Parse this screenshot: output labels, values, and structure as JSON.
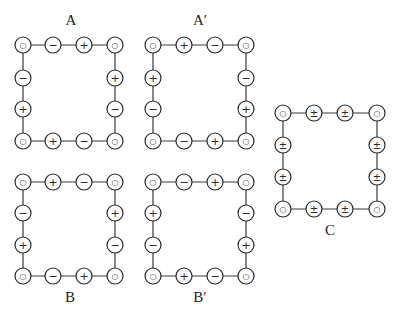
{
  "diagram": {
    "node_radius": 8,
    "symbols": {
      "o": "○",
      "+": "+",
      "-": "−",
      "pm": "±"
    },
    "panels": [
      {
        "id": "A",
        "label": "A",
        "label_pos": [
          71,
          25
        ],
        "xs": [
          23,
          53,
          84,
          115
        ],
        "ys": [
          45,
          78,
          109,
          141
        ],
        "top": [
          "o",
          "-",
          "+",
          "o"
        ],
        "left": [
          "-",
          "+"
        ],
        "right": [
          "+",
          "-"
        ],
        "bottom": [
          "o",
          "+",
          "-",
          "o"
        ]
      },
      {
        "id": "A-prime",
        "label": "A′",
        "label_pos": [
          200,
          25
        ],
        "xs": [
          153,
          184,
          215,
          246
        ],
        "ys": [
          45,
          78,
          109,
          141
        ],
        "top": [
          "o",
          "+",
          "-",
          "o"
        ],
        "left": [
          "+",
          "-"
        ],
        "right": [
          "-",
          "+"
        ],
        "bottom": [
          "o",
          "-",
          "+",
          "o"
        ]
      },
      {
        "id": "B",
        "label": "B",
        "label_pos": [
          70,
          302
        ],
        "xs": [
          23,
          53,
          84,
          115
        ],
        "ys": [
          182,
          213,
          245,
          276
        ],
        "top": [
          "o",
          "+",
          "-",
          "o"
        ],
        "left": [
          "-",
          "+"
        ],
        "right": [
          "+",
          "-"
        ],
        "bottom": [
          "o",
          "-",
          "+",
          "o"
        ]
      },
      {
        "id": "B-prime",
        "label": "B′",
        "label_pos": [
          200,
          302
        ],
        "xs": [
          153,
          184,
          215,
          246
        ],
        "ys": [
          182,
          213,
          245,
          276
        ],
        "top": [
          "o",
          "-",
          "+",
          "o"
        ],
        "left": [
          "+",
          "-"
        ],
        "right": [
          "-",
          "+"
        ],
        "bottom": [
          "o",
          "+",
          "-",
          "o"
        ]
      },
      {
        "id": "C",
        "label": "C",
        "label_pos": [
          330,
          235
        ],
        "xs": [
          283,
          314,
          345,
          377
        ],
        "ys": [
          113,
          145,
          177,
          209
        ],
        "top": [
          "o",
          "pm",
          "pm",
          "o"
        ],
        "left": [
          "pm",
          "pm"
        ],
        "right": [
          "pm",
          "pm"
        ],
        "bottom": [
          "o",
          "pm",
          "pm",
          "o"
        ]
      }
    ]
  }
}
